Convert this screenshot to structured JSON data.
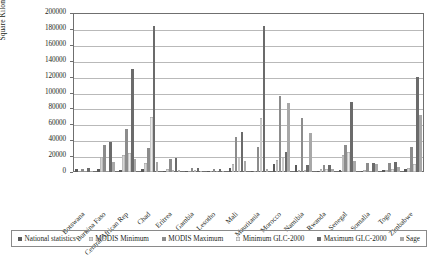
{
  "chart_data": {
    "type": "bar",
    "title": "",
    "xlabel": "",
    "ylabel": "Square Kilometers",
    "ylim": [
      0,
      200000
    ],
    "ytick_step": 20000,
    "yticks": [
      0,
      20000,
      40000,
      60000,
      80000,
      100000,
      120000,
      140000,
      160000,
      180000,
      200000
    ],
    "ytick_labels": [
      "0",
      "20000",
      "40000",
      "60000",
      "80000",
      "100000",
      "120000",
      "140000",
      "160000",
      "180000",
      "200000"
    ],
    "grid": "horizontal",
    "legend_position": "bottom",
    "categories": [
      "Botswana",
      "Burkina Faso",
      "Central African Rep",
      "Chad",
      "Eritrea",
      "Gambia",
      "Lesotho",
      "Mali",
      "Mauritania",
      "Morocco",
      "Namibia",
      "Rwanda",
      "Senegal",
      "Somalia",
      "Togo",
      "Zimbabwe"
    ],
    "series": [
      {
        "name": "National statistics",
        "color": "#595959",
        "values": [
          3800,
          3500,
          2000,
          3400,
          500,
          200,
          320,
          4700,
          400,
          9500,
          8200,
          1280,
          2600,
          1040,
          2500,
          3300
        ]
      },
      {
        "name": "MODIS Minimum",
        "color": "#d6d6d6",
        "values": [
          1200,
          19000,
          21000,
          11000,
          4200,
          1900,
          1100,
          10500,
          1000,
          14500,
          2000,
          3900,
          21500,
          2100,
          2800,
          5500
        ]
      },
      {
        "name": "MODIS Maximum",
        "color": "#8c8c8c",
        "values": [
          4300,
          34500,
          53500,
          30200,
          16500,
          4500,
          3600,
          44000,
          32000,
          96000,
          68500,
          8300,
          34500,
          11000,
          11500,
          32000
        ]
      },
      {
        "name": "Minimum GLC-2000",
        "color": "#eaeaea",
        "values": [
          1300,
          1500,
          24500,
          69000,
          3000,
          2200,
          1200,
          19500,
          68000,
          18500,
          2100,
          4200,
          25500,
          1900,
          3200,
          9500
        ]
      },
      {
        "name": "Maximum GLC-2000",
        "color": "#6b6b6b",
        "values": [
          4800,
          37500,
          129000,
          183500,
          17500,
          4600,
          3900,
          50000,
          184000,
          25500,
          9000,
          9200,
          88000,
          11500,
          12000,
          119000
        ]
      },
      {
        "name": "Sage",
        "color": "#a8a8a8",
        "values": [
          1500,
          12000,
          16500,
          12500,
          2000,
          1100,
          900,
          13500,
          4300,
          87000,
          49500,
          4200,
          13500,
          10500,
          5800,
          72000
        ]
      }
    ]
  },
  "legend": {
    "items": [
      {
        "label": "National statistics"
      },
      {
        "label": "MODIS Minimum"
      },
      {
        "label": "MODIS Maximum"
      },
      {
        "label": "Minimum GLC-2000"
      },
      {
        "label": "Maximum GLC-2000"
      },
      {
        "label": "Sage"
      }
    ]
  }
}
